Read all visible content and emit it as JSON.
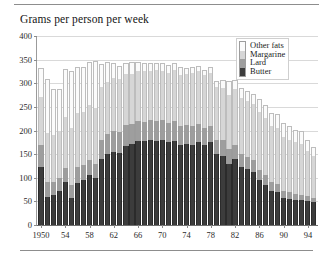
{
  "title": "Grams per person per week",
  "colors": {
    "butter": "#3c3c3c",
    "lard": "#9e9e9e",
    "margarine": "#d6d6d6",
    "other_fats": "#fbfbfb",
    "gridline": "#d9d9d9",
    "axis": "#6f6f6f",
    "text": "#1a1a1a"
  },
  "legend": {
    "position": "top-right",
    "items": [
      {
        "label": "Other fats",
        "color": "#fbfbfb"
      },
      {
        "label": "Margarine",
        "color": "#d6d6d6"
      },
      {
        "label": "Lard",
        "color": "#9e9e9e"
      },
      {
        "label": "Butter",
        "color": "#3c3c3c"
      }
    ]
  },
  "chart_data": {
    "type": "bar",
    "stacked": true,
    "title": "Grams per person per week",
    "xlabel": "",
    "ylabel": "",
    "ylim": [
      0,
      400
    ],
    "yticks": [
      0,
      50,
      100,
      150,
      200,
      250,
      300,
      350,
      400
    ],
    "grid": true,
    "legend_position": "top-right",
    "xtick_labels": [
      "1950",
      "54",
      "58",
      "62",
      "66",
      "70",
      "74",
      "78",
      "82",
      "86",
      "90",
      "94"
    ],
    "xtick_years": [
      1950,
      1954,
      1958,
      1962,
      1966,
      1970,
      1974,
      1978,
      1982,
      1986,
      1990,
      1994
    ],
    "categories": [
      1950,
      1951,
      1952,
      1953,
      1954,
      1955,
      1956,
      1957,
      1958,
      1959,
      1960,
      1961,
      1962,
      1963,
      1964,
      1965,
      1966,
      1967,
      1968,
      1969,
      1970,
      1971,
      1972,
      1973,
      1974,
      1975,
      1976,
      1977,
      1978,
      1979,
      1980,
      1981,
      1982,
      1983,
      1984,
      1985,
      1986,
      1987,
      1988,
      1989,
      1990,
      1991,
      1992,
      1993,
      1994,
      1995
    ],
    "series": [
      {
        "name": "Butter",
        "color": "#3c3c3c",
        "values": [
          122,
          60,
          63,
          73,
          90,
          57,
          88,
          95,
          105,
          100,
          140,
          150,
          155,
          152,
          168,
          172,
          178,
          178,
          180,
          178,
          180,
          176,
          178,
          170,
          172,
          170,
          176,
          170,
          175,
          150,
          147,
          130,
          140,
          122,
          118,
          112,
          95,
          85,
          72,
          70,
          57,
          55,
          52,
          52,
          50,
          48
        ]
      },
      {
        "name": "Lard",
        "color": "#9e9e9e",
        "values": [
          48,
          30,
          28,
          27,
          30,
          28,
          34,
          32,
          32,
          30,
          40,
          43,
          45,
          45,
          44,
          42,
          42,
          40,
          42,
          42,
          42,
          40,
          42,
          40,
          40,
          40,
          38,
          36,
          35,
          30,
          32,
          30,
          30,
          28,
          26,
          25,
          22,
          20,
          18,
          17,
          15,
          14,
          13,
          12,
          12,
          10
        ]
      },
      {
        "name": "Margarine",
        "color": "#d6d6d6",
        "values": [
          100,
          105,
          100,
          100,
          108,
          120,
          115,
          112,
          118,
          118,
          112,
          110,
          112,
          112,
          108,
          106,
          106,
          108,
          105,
          108,
          104,
          106,
          108,
          108,
          108,
          112,
          112,
          112,
          112,
          112,
          110,
          115,
          118,
          118,
          118,
          120,
          122,
          122,
          120,
          118,
          115,
          112,
          110,
          108,
          95,
          88
        ]
      },
      {
        "name": "Other fats",
        "color": "#fbfbfb",
        "values": [
          62,
          113,
          96,
          88,
          102,
          120,
          98,
          96,
          90,
          100,
          48,
          42,
          30,
          28,
          22,
          25,
          18,
          16,
          16,
          14,
          16,
          16,
          15,
          17,
          12,
          12,
          10,
          10,
          13,
          12,
          18,
          30,
          20,
          22,
          22,
          20,
          28,
          28,
          28,
          30,
          30,
          28,
          26,
          28,
          24,
          20
        ]
      }
    ]
  }
}
